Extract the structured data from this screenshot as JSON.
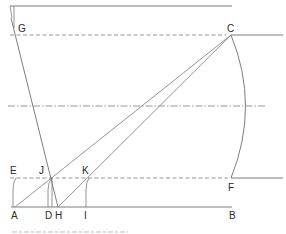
{
  "figure": {
    "points": {
      "A": "A",
      "B": "B",
      "C": "C",
      "D": "D",
      "E": "E",
      "F": "F",
      "G": "G",
      "H": "H",
      "I": "I",
      "J": "J",
      "K": "K"
    },
    "line_styles": {
      "solid": "construction line",
      "dashed": "dashed reference line",
      "dash_dot": "center line"
    },
    "colors": {
      "line": "#6e6e6e",
      "label": "#2a2a2a",
      "background": "#ffffff"
    }
  }
}
